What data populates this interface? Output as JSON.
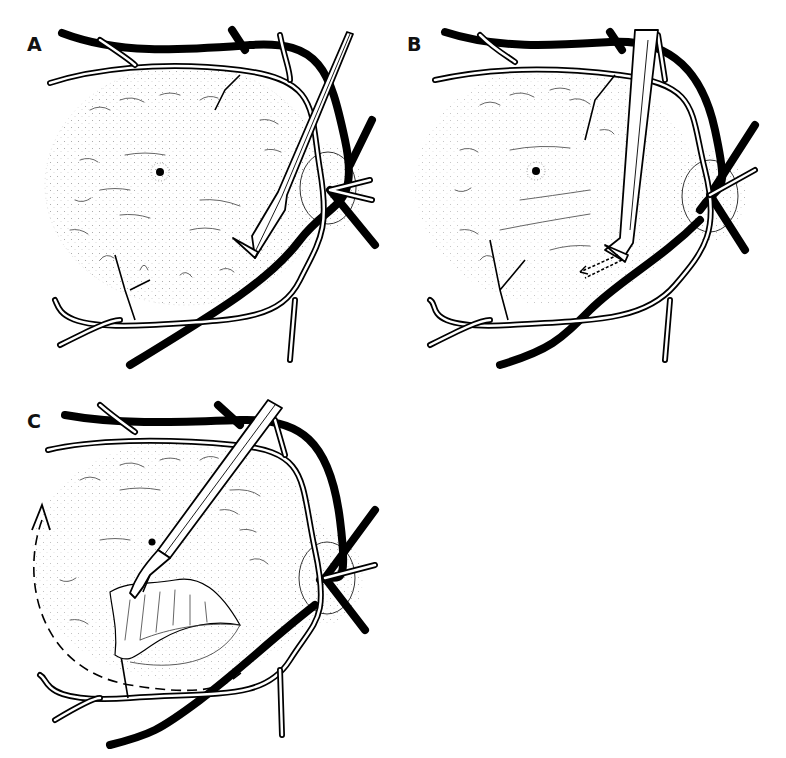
{
  "figure": {
    "panels": [
      {
        "id": "A",
        "label": "A",
        "description": "Retina with macular membrane; a lance/pick instrument approaches the inferior temporal edge of the membrane near the optic disc",
        "instrument": "lance-pick",
        "structures": [
          "retinal-vessels",
          "fovea",
          "optic-disc",
          "epiretinal-membrane"
        ]
      },
      {
        "id": "B",
        "label": "B",
        "description": "Bent-tip needle lifts an edge of the membrane; dashed arrows indicate direction of motion",
        "instrument": "bent-needle",
        "structures": [
          "retinal-vessels",
          "fovea",
          "optic-disc",
          "epiretinal-membrane",
          "motion-arrows"
        ]
      },
      {
        "id": "C",
        "label": "C",
        "description": "Forceps grasp and peel the membrane flap; dashed curved arrow indicates circular peeling direction",
        "instrument": "forceps",
        "structures": [
          "retinal-vessels",
          "fovea",
          "optic-disc",
          "peeled-membrane-flap",
          "curved-dashed-arrow"
        ]
      }
    ],
    "colors": {
      "ink": "#000000",
      "background": "#ffffff",
      "fine_lines": "#555555"
    }
  }
}
